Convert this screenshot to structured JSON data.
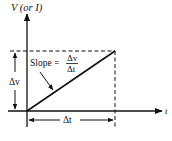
{
  "diagram": {
    "y_axis_label": "V (or I)",
    "x_axis_label": "t",
    "vertical_delta_label": "Δv",
    "horizontal_delta_label": "Δt",
    "slope_label": "Slope =",
    "slope_numerator": "Δv",
    "slope_denominator": "Δt",
    "line_color": "#111111"
  }
}
